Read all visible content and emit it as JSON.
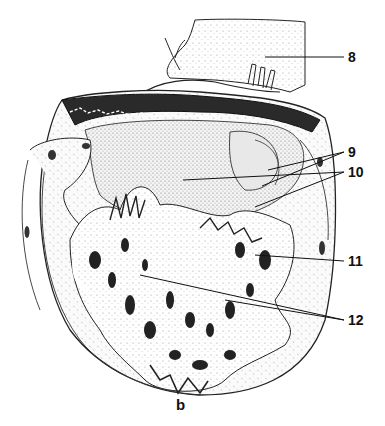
{
  "figure": {
    "panel_caption": "b",
    "line_color": "#111111",
    "background": "#ffffff",
    "labels": [
      {
        "id": "8",
        "text": "8",
        "x": 348,
        "y": 50
      },
      {
        "id": "9",
        "text": "9",
        "x": 348,
        "y": 145
      },
      {
        "id": "10",
        "text": "10",
        "x": 348,
        "y": 165
      },
      {
        "id": "11",
        "text": "11",
        "x": 348,
        "y": 254
      },
      {
        "id": "12",
        "text": "12",
        "x": 348,
        "y": 313
      }
    ]
  }
}
